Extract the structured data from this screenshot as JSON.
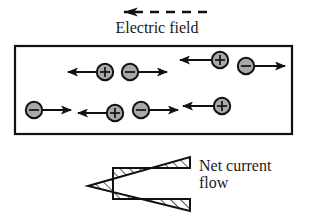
{
  "figure": {
    "width": 314,
    "height": 215,
    "background": "#ffffff"
  },
  "field_arrow": {
    "name": "electric-field-arrow",
    "direction": "left",
    "style": "dashed",
    "x_start": 205,
    "x_end": 118,
    "y": 12,
    "dash_pattern": "9 7",
    "color": "#111111"
  },
  "electric_field_label": {
    "text": "Electric field"
  },
  "conductor_box": {
    "name": "conductor-box",
    "x": 15,
    "y": 46,
    "width": 277,
    "height": 88,
    "stroke": "#111111",
    "stroke_width": 2.2,
    "fill": "#ffffff"
  },
  "charges": {
    "positive_symbol": "+",
    "negative_symbol": "−",
    "fill": "#a9a9a9",
    "stroke": "#111111",
    "radius": 8.2,
    "items": [
      {
        "id": "p1",
        "label": "positive-charge",
        "sign": "+",
        "cx": 105,
        "cy": 72,
        "arrow_dir": "left",
        "arrow_tail": 103,
        "arrow_head": 68
      },
      {
        "id": "n1",
        "label": "negative-charge",
        "sign": "−",
        "cx": 130,
        "cy": 72,
        "arrow_dir": "right",
        "arrow_tail": 132,
        "arrow_head": 167
      },
      {
        "id": "p2",
        "label": "positive-charge",
        "sign": "+",
        "cx": 220,
        "cy": 60,
        "arrow_dir": "left",
        "arrow_tail": 218,
        "arrow_head": 180
      },
      {
        "id": "n2",
        "label": "negative-charge",
        "sign": "−",
        "cx": 246,
        "cy": 66,
        "arrow_dir": "right",
        "arrow_tail": 248,
        "arrow_head": 285
      },
      {
        "id": "n3",
        "label": "negative-charge",
        "sign": "−",
        "cx": 34,
        "cy": 110,
        "arrow_dir": "right",
        "arrow_tail": 36,
        "arrow_head": 71
      },
      {
        "id": "p3",
        "label": "positive-charge",
        "sign": "+",
        "cx": 115,
        "cy": 113,
        "arrow_dir": "left",
        "arrow_tail": 113,
        "arrow_head": 78
      },
      {
        "id": "n4",
        "label": "negative-charge",
        "sign": "−",
        "cx": 141,
        "cy": 110,
        "arrow_dir": "right",
        "arrow_tail": 143,
        "arrow_head": 178
      },
      {
        "id": "p4",
        "label": "positive-charge",
        "sign": "+",
        "cx": 222,
        "cy": 106,
        "arrow_dir": "left",
        "arrow_tail": 220,
        "arrow_head": 183
      }
    ]
  },
  "current_arrow": {
    "name": "net-current-arrow",
    "direction": "left",
    "fill": "#ffffff",
    "stroke": "#111111",
    "hatch_color": "#111111",
    "points": "190,168 190,157 88,186 190,211 190,199 113,199 113,168"
  },
  "net_current_label": {
    "line1": "Net current",
    "line2": "flow",
    "text": "Net current\nflow"
  }
}
